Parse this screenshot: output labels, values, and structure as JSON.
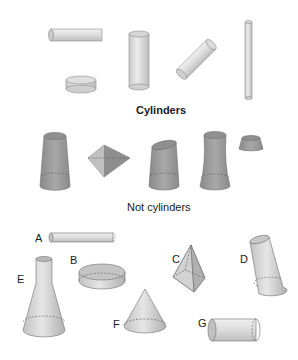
{
  "sections": {
    "cylinders": {
      "title": "Cylinders"
    },
    "not_cylinders": {
      "title": "Not cylinders"
    }
  },
  "exercise": {
    "labels": [
      "A",
      "B",
      "C",
      "D",
      "E",
      "F",
      "G"
    ]
  },
  "colors": {
    "light_shape": "#d9d9d9",
    "dark_shape": "#9e9e9e",
    "outline": "#6f6f6f"
  }
}
